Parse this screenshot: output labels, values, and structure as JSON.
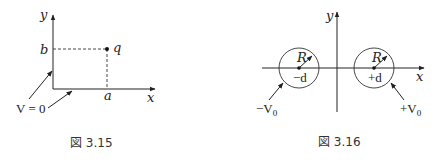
{
  "figures": [
    {
      "caption": "図 3.15",
      "axis_x_label": "x",
      "axis_y_label": "y",
      "x_tick_label": "a",
      "y_tick_label": "b",
      "point_label": "q",
      "boundary_label": "V = 0"
    },
    {
      "caption": "図 3.16",
      "axis_x_label": "x",
      "axis_y_label": "y",
      "left_circle": {
        "radius_label": "R",
        "center_label": "−d",
        "potential_label": "−V",
        "potential_sub": "0"
      },
      "right_circle": {
        "radius_label": "R",
        "center_label": "+d",
        "potential_label": "+V",
        "potential_sub": "0"
      }
    }
  ]
}
